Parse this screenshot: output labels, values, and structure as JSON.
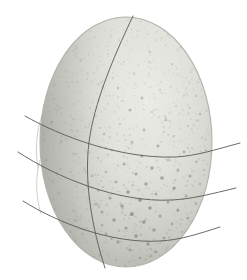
{
  "scene": {
    "width": 247,
    "height": 280,
    "background_color": "#ffffff",
    "subject": "speckled egg with drawn grid lines",
    "description": "A pale grey speckled egg photographed against a white background, overlaid with one curved vertical meridian line and three curved horizontal latitude lines that extend past the egg silhouette on both the left and right sides."
  },
  "egg": {
    "name": "speckled-egg",
    "center_x": 126,
    "center_y": 142,
    "radius_x": 86,
    "radius_y": 125,
    "shell_base_color": "#cfcfca",
    "shell_highlight_color": "#e8e8e3",
    "shell_shadow_color": "#a8a8a3",
    "outline_color": "#b4b4ae",
    "speckle_color": "#6f6f68",
    "speckle_density_upper": "sparse",
    "speckle_density_lower": "dense"
  },
  "grid": {
    "line_color": "#5a5a56",
    "line_width": 0.9,
    "faint_line_color": "#c9c9c4",
    "meridian": {
      "label": "meridian-line",
      "path": "M 133 16 C 112 60, 94 104, 89 142 C 84 182, 92 228, 105 268"
    },
    "latitudes": [
      {
        "label": "latitude-line-1",
        "path": "M 25 116 C 60 136, 120 159, 175 157 C 196 156, 214 150, 240 143"
      },
      {
        "label": "latitude-line-2",
        "path": "M 18 152 C 56 177, 118 203, 172 200 C 192 199, 211 194, 236 188"
      },
      {
        "label": "latitude-line-3",
        "path": "M 23 201 C 58 223, 112 244, 160 241 C 180 240, 198 234, 220 227"
      }
    ],
    "limb_arcs": [
      {
        "label": "limb-arc-upper",
        "path": "M 43 113 C 36 130, 35 150, 38 168"
      },
      {
        "label": "limb-arc-lower",
        "path": "M 40 160 C 35 178, 36 198, 41 214"
      }
    ]
  },
  "speckles": [
    {
      "x": 150,
      "y": 52,
      "r": 1.1,
      "o": 0.3
    },
    {
      "x": 172,
      "y": 64,
      "r": 0.9,
      "o": 0.26
    },
    {
      "x": 134,
      "y": 74,
      "r": 1.0,
      "o": 0.22
    },
    {
      "x": 186,
      "y": 78,
      "r": 0.8,
      "o": 0.24
    },
    {
      "x": 118,
      "y": 88,
      "r": 1.2,
      "o": 0.28
    },
    {
      "x": 160,
      "y": 90,
      "r": 1.0,
      "o": 0.25
    },
    {
      "x": 196,
      "y": 96,
      "r": 1.1,
      "o": 0.3
    },
    {
      "x": 142,
      "y": 98,
      "r": 1.4,
      "o": 0.38
    },
    {
      "x": 108,
      "y": 104,
      "r": 0.9,
      "o": 0.22
    },
    {
      "x": 176,
      "y": 106,
      "r": 1.0,
      "o": 0.27
    },
    {
      "x": 130,
      "y": 110,
      "r": 1.5,
      "o": 0.42
    },
    {
      "x": 152,
      "y": 112,
      "r": 1.1,
      "o": 0.3
    },
    {
      "x": 200,
      "y": 114,
      "r": 1.2,
      "o": 0.33
    },
    {
      "x": 96,
      "y": 116,
      "r": 1.0,
      "o": 0.26
    },
    {
      "x": 166,
      "y": 120,
      "r": 1.3,
      "o": 0.35
    },
    {
      "x": 120,
      "y": 124,
      "r": 1.1,
      "o": 0.28
    },
    {
      "x": 188,
      "y": 126,
      "r": 1.0,
      "o": 0.27
    },
    {
      "x": 144,
      "y": 130,
      "r": 1.4,
      "o": 0.38
    },
    {
      "x": 104,
      "y": 134,
      "r": 1.2,
      "o": 0.31
    },
    {
      "x": 174,
      "y": 136,
      "r": 1.1,
      "o": 0.29
    },
    {
      "x": 202,
      "y": 138,
      "r": 0.9,
      "o": 0.24
    },
    {
      "x": 132,
      "y": 142,
      "r": 1.3,
      "o": 0.34
    },
    {
      "x": 158,
      "y": 146,
      "r": 1.5,
      "o": 0.44
    },
    {
      "x": 112,
      "y": 150,
      "r": 1.2,
      "o": 0.32
    },
    {
      "x": 184,
      "y": 152,
      "r": 1.4,
      "o": 0.4
    },
    {
      "x": 142,
      "y": 156,
      "r": 1.6,
      "o": 0.46
    },
    {
      "x": 98,
      "y": 158,
      "r": 1.1,
      "o": 0.3
    },
    {
      "x": 168,
      "y": 160,
      "r": 1.3,
      "o": 0.36
    },
    {
      "x": 196,
      "y": 162,
      "r": 1.2,
      "o": 0.33
    },
    {
      "x": 124,
      "y": 164,
      "r": 1.5,
      "o": 0.43
    },
    {
      "x": 152,
      "y": 168,
      "r": 1.7,
      "o": 0.5
    },
    {
      "x": 178,
      "y": 170,
      "r": 1.4,
      "o": 0.4
    },
    {
      "x": 106,
      "y": 172,
      "r": 1.3,
      "o": 0.36
    },
    {
      "x": 136,
      "y": 174,
      "r": 1.6,
      "o": 0.47
    },
    {
      "x": 190,
      "y": 176,
      "r": 1.5,
      "o": 0.42
    },
    {
      "x": 162,
      "y": 178,
      "r": 1.8,
      "o": 0.52
    },
    {
      "x": 116,
      "y": 182,
      "r": 1.4,
      "o": 0.4
    },
    {
      "x": 146,
      "y": 184,
      "r": 1.7,
      "o": 0.49
    },
    {
      "x": 200,
      "y": 184,
      "r": 1.2,
      "o": 0.32
    },
    {
      "x": 174,
      "y": 188,
      "r": 1.6,
      "o": 0.46
    },
    {
      "x": 98,
      "y": 190,
      "r": 1.3,
      "o": 0.35
    },
    {
      "x": 128,
      "y": 192,
      "r": 1.8,
      "o": 0.54
    },
    {
      "x": 156,
      "y": 194,
      "r": 1.5,
      "o": 0.43
    },
    {
      "x": 186,
      "y": 196,
      "r": 1.4,
      "o": 0.39
    },
    {
      "x": 110,
      "y": 198,
      "r": 1.6,
      "o": 0.47
    },
    {
      "x": 140,
      "y": 200,
      "r": 1.9,
      "o": 0.56
    },
    {
      "x": 168,
      "y": 202,
      "r": 1.5,
      "o": 0.44
    },
    {
      "x": 196,
      "y": 204,
      "r": 1.2,
      "o": 0.33
    },
    {
      "x": 122,
      "y": 206,
      "r": 1.7,
      "o": 0.5
    },
    {
      "x": 150,
      "y": 208,
      "r": 1.8,
      "o": 0.53
    },
    {
      "x": 178,
      "y": 210,
      "r": 1.4,
      "o": 0.4
    },
    {
      "x": 102,
      "y": 212,
      "r": 1.5,
      "o": 0.43
    },
    {
      "x": 132,
      "y": 214,
      "r": 1.9,
      "o": 0.57
    },
    {
      "x": 160,
      "y": 216,
      "r": 1.6,
      "o": 0.46
    },
    {
      "x": 188,
      "y": 218,
      "r": 1.3,
      "o": 0.35
    },
    {
      "x": 114,
      "y": 220,
      "r": 1.7,
      "o": 0.5
    },
    {
      "x": 144,
      "y": 222,
      "r": 1.8,
      "o": 0.53
    },
    {
      "x": 172,
      "y": 224,
      "r": 1.4,
      "o": 0.39
    },
    {
      "x": 126,
      "y": 228,
      "r": 1.6,
      "o": 0.47
    },
    {
      "x": 154,
      "y": 230,
      "r": 1.7,
      "o": 0.49
    },
    {
      "x": 182,
      "y": 232,
      "r": 1.2,
      "o": 0.32
    },
    {
      "x": 106,
      "y": 234,
      "r": 1.4,
      "o": 0.4
    },
    {
      "x": 136,
      "y": 236,
      "r": 1.8,
      "o": 0.52
    },
    {
      "x": 164,
      "y": 238,
      "r": 1.5,
      "o": 0.42
    },
    {
      "x": 118,
      "y": 242,
      "r": 1.6,
      "o": 0.45
    },
    {
      "x": 148,
      "y": 244,
      "r": 1.7,
      "o": 0.48
    },
    {
      "x": 174,
      "y": 246,
      "r": 1.2,
      "o": 0.31
    },
    {
      "x": 130,
      "y": 250,
      "r": 1.5,
      "o": 0.42
    },
    {
      "x": 156,
      "y": 252,
      "r": 1.4,
      "o": 0.38
    },
    {
      "x": 140,
      "y": 258,
      "r": 1.3,
      "o": 0.34
    },
    {
      "x": 164,
      "y": 132,
      "r": 1.0,
      "o": 0.25
    },
    {
      "x": 190,
      "y": 108,
      "r": 0.9,
      "o": 0.22
    },
    {
      "x": 124,
      "y": 62,
      "r": 0.9,
      "o": 0.2
    },
    {
      "x": 156,
      "y": 40,
      "r": 0.8,
      "o": 0.18
    },
    {
      "x": 180,
      "y": 48,
      "r": 0.8,
      "o": 0.19
    },
    {
      "x": 100,
      "y": 128,
      "r": 1.0,
      "o": 0.26
    },
    {
      "x": 206,
      "y": 150,
      "r": 1.1,
      "o": 0.28
    },
    {
      "x": 92,
      "y": 176,
      "r": 1.2,
      "o": 0.32
    },
    {
      "x": 204,
      "y": 170,
      "r": 1.1,
      "o": 0.29
    },
    {
      "x": 96,
      "y": 204,
      "r": 1.3,
      "o": 0.34
    }
  ]
}
